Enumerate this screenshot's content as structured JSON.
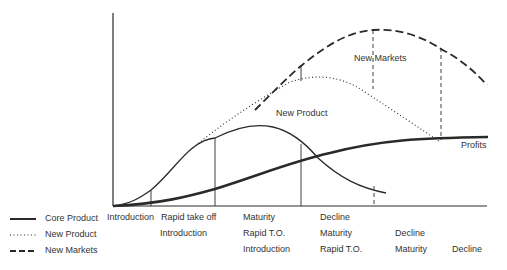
{
  "diagram": {
    "type": "product-life-cycle",
    "curve_labels": {
      "new_product": "New Product",
      "new_markets": "New Markets",
      "profits": "Profits"
    },
    "legend": [
      {
        "style": "solid",
        "label": "Core Product"
      },
      {
        "style": "dotted",
        "label": "New Product"
      },
      {
        "style": "dashed",
        "label": "New Markets"
      }
    ],
    "stage_rows": {
      "core_product": [
        "Introduction",
        "Rapid take off",
        "Maturity",
        "Decline"
      ],
      "new_product": [
        "Introduction",
        "Rapid T.O.",
        "Maturity",
        "Decline"
      ],
      "new_markets": [
        "Introduction",
        "Rapid T.O.",
        "Maturity",
        "Decline"
      ]
    },
    "colors": {
      "line": "#2a2a2a",
      "background": "#ffffff"
    }
  }
}
